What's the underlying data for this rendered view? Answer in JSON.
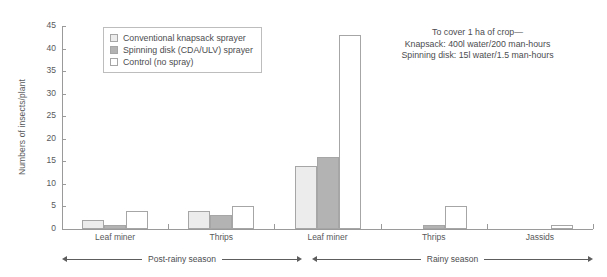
{
  "chart_data": {
    "type": "bar",
    "title": "",
    "xlabel": "",
    "ylabel": "Numbers of insects/plant",
    "ylim": [
      0,
      45
    ],
    "ytick_labels": [
      "0",
      "5",
      "10",
      "15",
      "20",
      "25",
      "30",
      "35",
      "40",
      "45"
    ],
    "yticks": [
      0,
      5,
      10,
      15,
      20,
      25,
      30,
      35,
      40,
      45
    ],
    "grid": false,
    "legend_position": "top-left",
    "categories": [
      "Leaf miner",
      "Thrips",
      "Leaf miner",
      "Thrips",
      "Jassids"
    ],
    "groups": [
      {
        "category": "Leaf miner",
        "season": "Post-rainy season"
      },
      {
        "category": "Thrips",
        "season": "Post-rainy season"
      },
      {
        "category": "Leaf miner",
        "season": "Rainy season"
      },
      {
        "category": "Thrips",
        "season": "Rainy season"
      },
      {
        "category": "Jassids",
        "season": "Rainy season"
      }
    ],
    "series": [
      {
        "name": "Conventional knapsack sprayer",
        "color": "#ececec",
        "values": [
          2,
          4,
          14,
          0,
          0
        ]
      },
      {
        "name": "Spinning disk (CDA/ULV) sprayer",
        "color": "#b3b3b3",
        "values": [
          1,
          3,
          16,
          1,
          0
        ]
      },
      {
        "name": "Control (no spray)",
        "color": "#ffffff",
        "values": [
          4,
          5,
          43,
          5,
          1
        ]
      }
    ],
    "annotations": [
      "To cover 1 ha of crop—",
      "Knapsack: 400l water/200 man-hours",
      "Spinning disk: 15l water/1.5 man-hours"
    ],
    "season_bands": [
      {
        "label": "Post-rainy season"
      },
      {
        "label": "Rainy season"
      }
    ]
  },
  "legend": {
    "items": [
      {
        "label": "Conventional knapsack sprayer",
        "color": "#ececec"
      },
      {
        "label": "Spinning disk (CDA/ULV) sprayer",
        "color": "#b3b3b3"
      },
      {
        "label": "Control (no spray)",
        "color": "#ffffff"
      }
    ]
  },
  "note": {
    "line1": "To cover 1 ha of crop—",
    "line2": "Knapsack: 400l water/200 man-hours",
    "line3": "Spinning disk: 15l water/1.5 man-hours"
  },
  "axis": {
    "y_title": "Numbers of insects/plant"
  },
  "seasons": {
    "post_rainy": "Post-rainy season",
    "rainy": "Rainy season"
  }
}
